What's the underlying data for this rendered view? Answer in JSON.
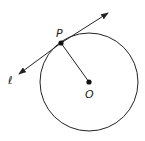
{
  "diagram": {
    "labels": {
      "point_p": "P",
      "center_o": "O",
      "line_l": "ℓ"
    },
    "circle": {
      "cx": 89,
      "cy": 82,
      "r": 49
    },
    "point_p": {
      "x": 61,
      "y": 43
    },
    "tangent_line": {
      "x1": 18,
      "y1": 75,
      "x2": 108,
      "y2": 13
    },
    "colors": {
      "stroke": "#222222"
    }
  }
}
